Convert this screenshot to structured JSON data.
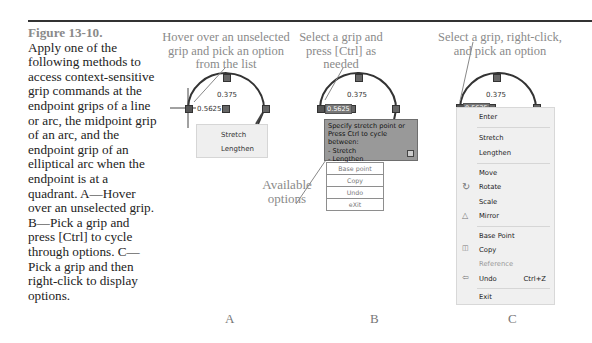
{
  "caption": {
    "figure_label": "Figure 13-10.",
    "text": "Apply one of the following methods to access context-sensitive grip commands at the endpoint grips of a line or arc, the midpoint grip of an arc, and the endpoint grip of an elliptical arc when the endpoint is at a quadrant. A—Hover over an unselected grip. B—Pick a grip and press [Ctrl] to cycle through options. C—Pick a grip and then right-click to display options."
  },
  "panels": {
    "A": {
      "letter": "A",
      "callout": "Hover over an unselected grip and pick an option from the list",
      "dim_top": "0.375",
      "dim_left": "0.5625",
      "menu": [
        "Stretch",
        "Lengthen"
      ]
    },
    "B": {
      "letter": "B",
      "callout": "Select a grip and press [Ctrl] as needed",
      "dim_top": "0.375",
      "dim_left": "0.5625",
      "tooltip": {
        "line1": "Specify stretch point or",
        "line2": "Press Ctrl to cycle between:",
        "opt1": "- Stretch",
        "opt2": "- Lengthen"
      },
      "side_callout": "Available options",
      "list": [
        "Base point",
        "Copy",
        "Undo",
        "eXit"
      ]
    },
    "C": {
      "letter": "C",
      "callout": "Select a grip, right-click, and pick an option",
      "dim_top": "0.375",
      "dim_left": "0.5625",
      "menu": {
        "enter": "Enter",
        "stretch": "Stretch",
        "lengthen": "Lengthen",
        "move": "Move",
        "rotate": "Rotate",
        "scale": "Scale",
        "mirror": "Mirror",
        "base_point": "Base Point",
        "copy": "Copy",
        "reference": "Reference",
        "undo": "Undo",
        "undo_shortcut": "Ctrl+Z",
        "exit": "Exit"
      }
    }
  }
}
